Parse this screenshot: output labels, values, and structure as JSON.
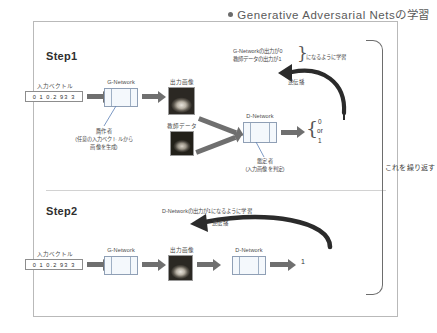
{
  "title": {
    "text": "Generative Adversarial Netsの学習",
    "bullet_icon": "bullet-dot"
  },
  "repeat": {
    "label": "これを繰り返す"
  },
  "step1": {
    "heading": "Step1",
    "input_vector_label": "入力ベクトル",
    "input_vector_value": "0 1 0.2 93 3",
    "g_network_label": "G-Network",
    "g_network_note_line1": "贋作者",
    "g_network_note_line2": "(任意の入力ベクトルから",
    "g_network_note_line3": "画像を生成)",
    "output_image_label": "出力画像",
    "teacher_data_label": "教師データ",
    "d_network_label": "D-Network",
    "d_network_note_line1": "鑑定者",
    "d_network_note_line2": "(入力画像を判定)",
    "backprop_label": "逆伝播",
    "objective_line1": "G-Networkの出力が0",
    "objective_line2": "教師データの出力が1",
    "objective_suffix": "になるように学習",
    "result_top": "0",
    "result_mid": "or",
    "result_bottom": "1"
  },
  "step2": {
    "heading": "Step2",
    "input_vector_label": "入力ベクトル",
    "input_vector_value": "0 1 0.2 93 3",
    "g_network_label": "G-Network",
    "output_image_label": "出力画像",
    "d_network_label": "D-Network",
    "backprop_label": "逆伝播",
    "objective": "D-Networkの出力が1になるように学習",
    "result": "1"
  },
  "colors": {
    "frame_border": "#b9b9b9",
    "arrow": "#6f6f6f",
    "network_fill": "#f4f8fc",
    "network_border": "#8f9fb5",
    "callout_line": "#5b7fb5",
    "text": "#3c3c3c"
  }
}
